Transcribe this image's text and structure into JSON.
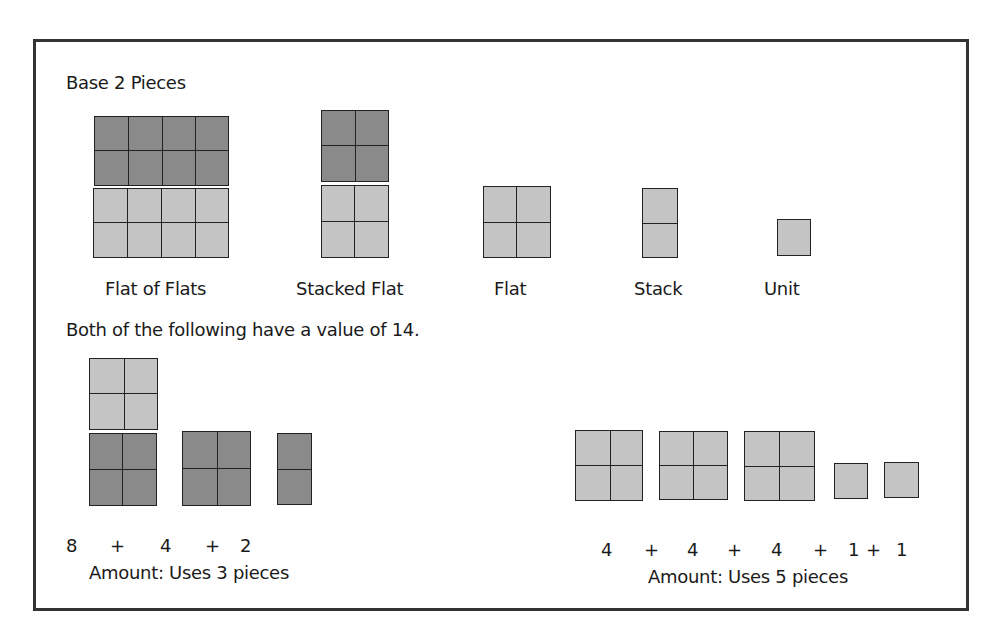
{
  "title": "Base 2 Pieces",
  "pieces": [
    {
      "name": "Flat of Flats",
      "value": 16
    },
    {
      "name": "Stacked Flat",
      "value": 8
    },
    {
      "name": "Flat",
      "value": 4
    },
    {
      "name": "Stack",
      "value": 2
    },
    {
      "name": "Unit",
      "value": 1
    }
  ],
  "subtitle": "Both of the following have a value of 14.",
  "example1": {
    "equation": [
      "8",
      "+",
      "4",
      "+",
      "2"
    ],
    "amount": "Amount: Uses 3 pieces"
  },
  "example2": {
    "equation": [
      "4",
      "+",
      "4",
      "+",
      "4",
      "+",
      "1",
      "+",
      "1"
    ],
    "amount": "Amount: Uses 5 pieces"
  },
  "colors": {
    "dark": "#8a8a8a",
    "light": "#c4c4c4",
    "border": "#222222"
  }
}
